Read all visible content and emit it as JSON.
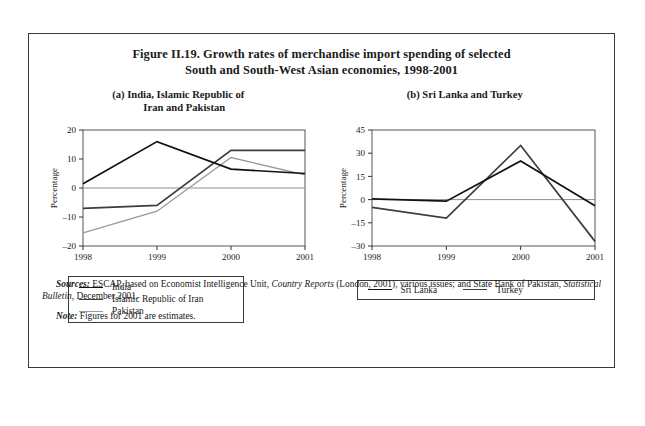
{
  "figure": {
    "title_line1": "Figure II.19.  Growth rates of merchandise import spending of selected",
    "title_line2": "South and South-West Asian economies, 1998-2001"
  },
  "panel_a": {
    "title_line1": "(a)   India, Islamic Republic of",
    "title_line2": "Iran and Pakistan",
    "legend": [
      {
        "label": "India",
        "color": "#111111"
      },
      {
        "label": "Islamic Republic of Iran",
        "color": "#3d3d3d"
      },
      {
        "label": "Pakistan",
        "color": "#9a9a9a"
      }
    ]
  },
  "panel_b": {
    "title_line1": "(b)   Sri Lanka and Turkey",
    "legend": [
      {
        "label": "Sri Lanka",
        "color": "#111111"
      },
      {
        "label": "Turkey",
        "color": "#3d3d3d"
      }
    ]
  },
  "notes": {
    "sources_label": "Sources:",
    "sources_text_1": "ESCAP, based on Economist Intelligence Unit,",
    "sources_italic_1": "Country Reports",
    "sources_text_2": "(London, 2001), various issues; and State Bank of Pakistan,",
    "sources_italic_2": "Statistical Bulletin,",
    "sources_text_3": "December 2001.",
    "note_label": "Note:",
    "note_text": "Figures for 2001 are estimates."
  },
  "chart_data": [
    {
      "type": "line",
      "title": "(a) India, Islamic Republic of Iran and Pakistan",
      "xlabel": "",
      "ylabel": "Percentage",
      "categories": [
        "1998",
        "1999",
        "2000",
        "2001"
      ],
      "x": [
        1998,
        1999,
        2000,
        2001
      ],
      "ylim": [
        -20,
        20
      ],
      "yticks": [
        20,
        10,
        0,
        -10,
        -20
      ],
      "grid": false,
      "legend_position": "below",
      "series": [
        {
          "name": "India",
          "color": "#111111",
          "values": [
            1.5,
            16.0,
            6.5,
            5.0
          ]
        },
        {
          "name": "Islamic Republic of Iran",
          "color": "#3d3d3d",
          "values": [
            -7.0,
            -6.0,
            13.0,
            13.0
          ]
        },
        {
          "name": "Pakistan",
          "color": "#9a9a9a",
          "values": [
            -15.5,
            -8.0,
            10.5,
            4.5
          ]
        }
      ]
    },
    {
      "type": "line",
      "title": "(b) Sri Lanka and Turkey",
      "xlabel": "",
      "ylabel": "Percentage",
      "categories": [
        "1998",
        "1999",
        "2000",
        "2001"
      ],
      "x": [
        1998,
        1999,
        2000,
        2001
      ],
      "ylim": [
        -30,
        45
      ],
      "yticks": [
        45,
        30,
        15,
        0,
        -15,
        -30
      ],
      "grid": false,
      "legend_position": "below",
      "series": [
        {
          "name": "Sri Lanka",
          "color": "#111111",
          "values": [
            0.5,
            -1.0,
            25.0,
            -4.0
          ]
        },
        {
          "name": "Turkey",
          "color": "#3d3d3d",
          "values": [
            -5.0,
            -12.0,
            35.0,
            -27.0
          ]
        }
      ]
    }
  ]
}
